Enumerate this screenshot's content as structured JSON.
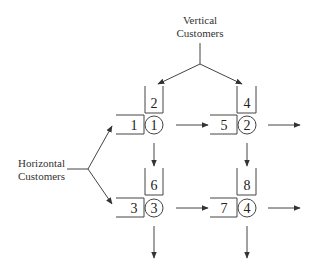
{
  "labels": {
    "vertical_line1": "Vertical",
    "vertical_line2": "Customers",
    "horizontal_line1": "Horizontal",
    "horizontal_line2": "Customers"
  },
  "nodes": [
    {
      "server": "1",
      "horizontal_queue": "1",
      "vertical_queue": "2"
    },
    {
      "server": "2",
      "horizontal_queue": "5",
      "vertical_queue": "4"
    },
    {
      "server": "3",
      "horizontal_queue": "3",
      "vertical_queue": "6"
    },
    {
      "server": "4",
      "horizontal_queue": "7",
      "vertical_queue": "8"
    }
  ],
  "colors": {
    "line": "#444444",
    "text": "#222222",
    "background": "#ffffff"
  }
}
